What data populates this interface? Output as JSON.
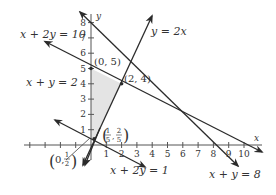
{
  "axes": {
    "x_label": "x",
    "y_label": "y",
    "x_ticks": [
      "1",
      "2",
      "3",
      "4",
      "5",
      "6",
      "7",
      "8",
      "9",
      "10"
    ],
    "y_ticks": [
      "1",
      "2",
      "3",
      "4",
      "5",
      "6",
      "7",
      "8"
    ],
    "x_range": [
      -4,
      10.8
    ],
    "y_range": [
      -1.5,
      8.8
    ]
  },
  "lines": [
    {
      "equation": "x + 2y = 10",
      "label": "x + 2y = 10"
    },
    {
      "equation": "x + y = 2",
      "label": "x + y = 2"
    },
    {
      "equation": "y = 2x",
      "label": "y = 2x"
    },
    {
      "equation": "x + y = 8",
      "label": "x + y = 8"
    },
    {
      "equation": "x + 2y = 1",
      "label": "x + 2y = 1"
    }
  ],
  "points": [
    {
      "label": "(0, 5)",
      "x": 0,
      "y": 5
    },
    {
      "label": "(2, 4)",
      "x": 2,
      "y": 4
    },
    {
      "label_num1": "1",
      "label_den1": "5",
      "label_num2": "2",
      "label_den2": "5",
      "x": 0.2,
      "y": 0.4
    },
    {
      "label_num": "1",
      "label_den": "2",
      "x": 0,
      "y": 0.5
    }
  ],
  "shaded_region": {
    "vertices": [
      [
        0,
        5
      ],
      [
        2,
        4
      ],
      [
        0.2,
        0.4
      ],
      [
        0,
        0.5
      ]
    ],
    "color": "#e4e4e4"
  },
  "colors": {
    "line": "#2b2b2b",
    "text": "#333333",
    "shade": "#e4e4e4"
  }
}
